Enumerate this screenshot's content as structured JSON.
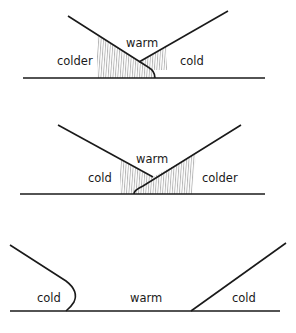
{
  "diagram": {
    "panels": [
      {
        "id": "panel-1",
        "labels": {
          "left": "colder",
          "center": "warm",
          "right": "cold"
        }
      },
      {
        "id": "panel-2",
        "labels": {
          "left": "cold",
          "center": "warm",
          "right": "colder"
        }
      },
      {
        "id": "panel-3",
        "labels": {
          "left": "cold",
          "center": "warm",
          "right": "cold"
        }
      }
    ]
  }
}
